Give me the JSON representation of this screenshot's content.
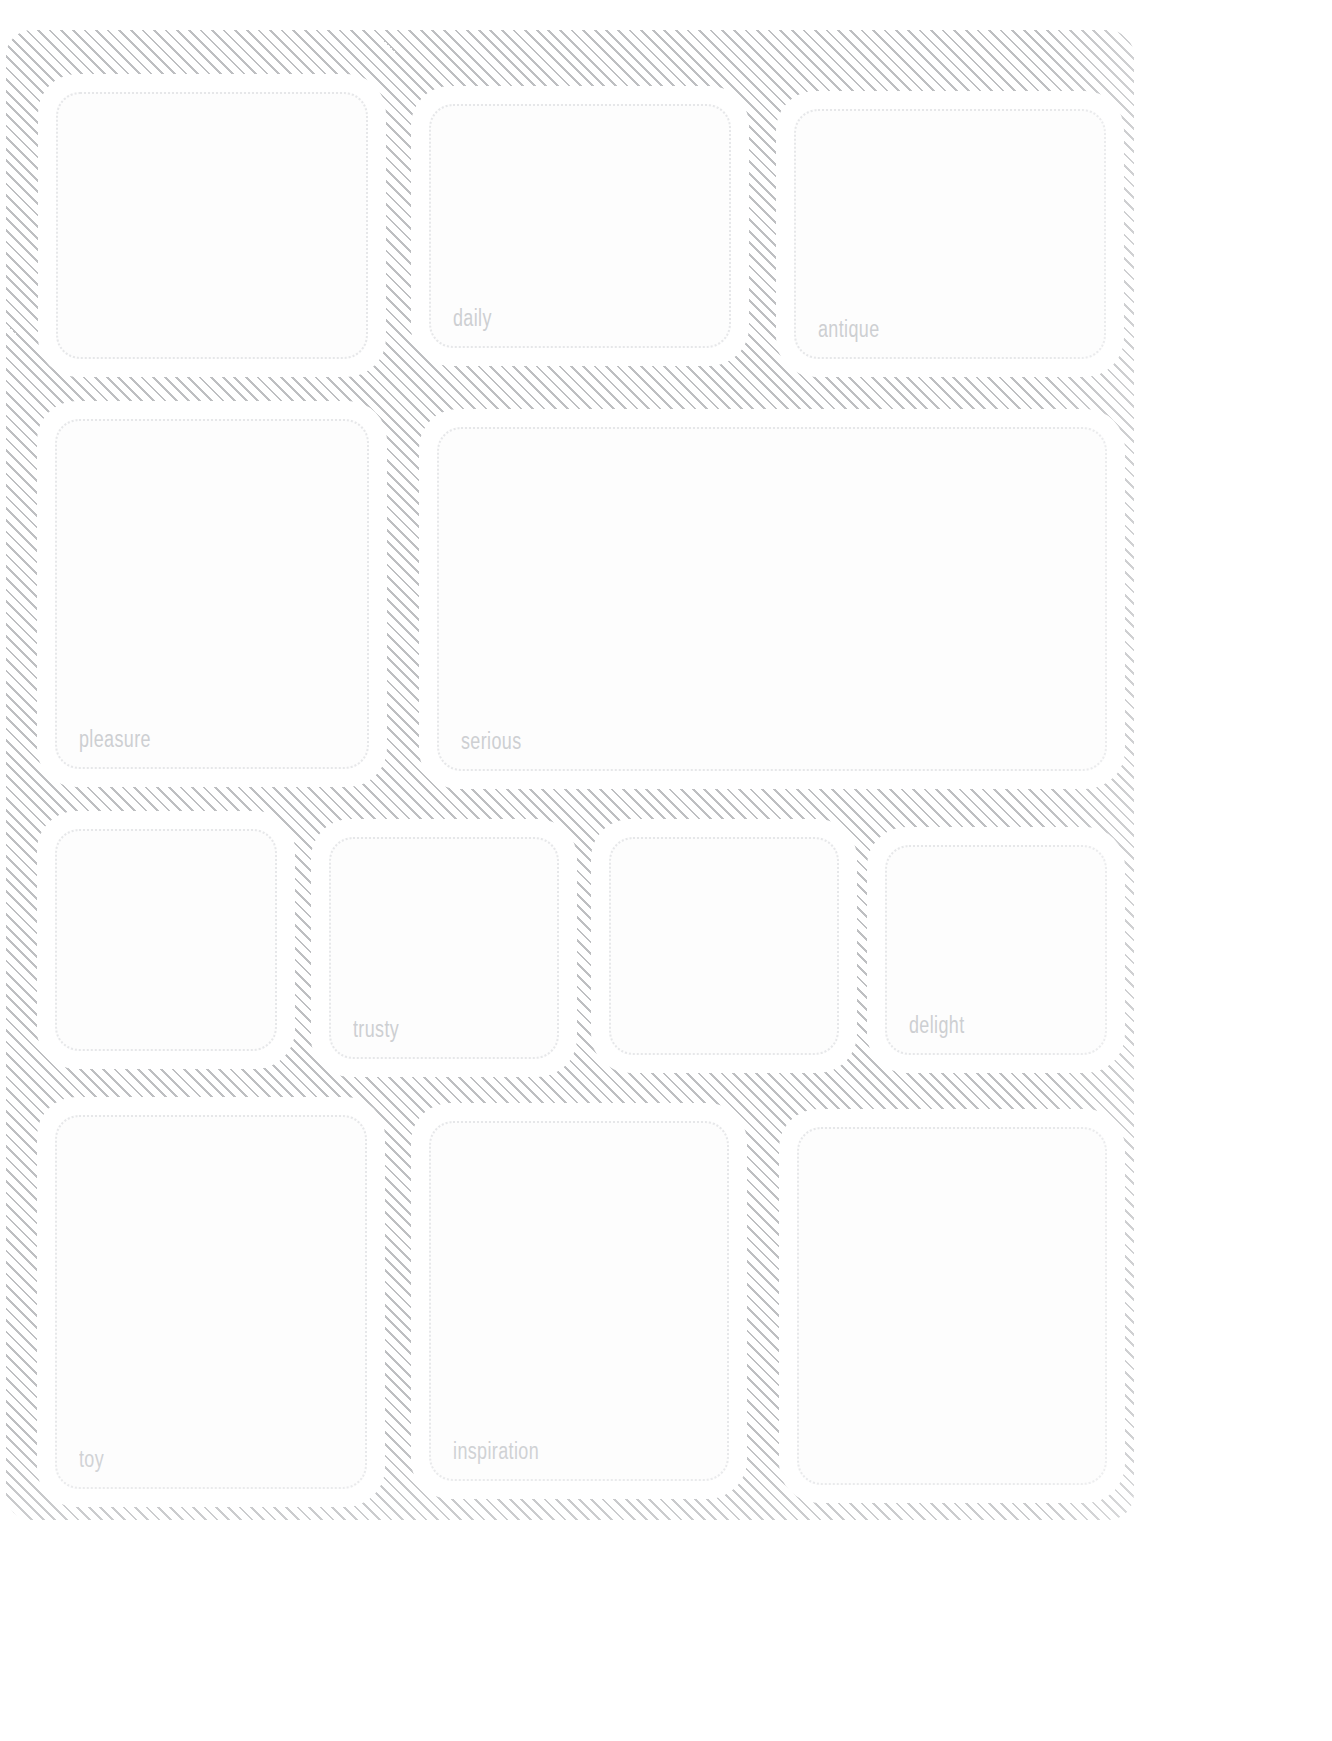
{
  "page": {
    "background_style": "diagonal-hatch",
    "hatch_color": "#96989c",
    "card_fill": "#ffffff",
    "card_border_color": "#e6e7e9",
    "label_color": "#cdcfd2"
  },
  "grid": {
    "rows": [
      {
        "row_name": "row-1",
        "cards": [
          {
            "label": "",
            "x": 47,
            "y": 83,
            "w": 330,
            "h": 285
          },
          {
            "label": "daily",
            "x": 420,
            "y": 95,
            "w": 320,
            "h": 262
          },
          {
            "label": "antique",
            "x": 785,
            "y": 100,
            "w": 330,
            "h": 268
          }
        ]
      },
      {
        "row_name": "row-2",
        "cards": [
          {
            "label": "pleasure",
            "x": 46,
            "y": 410,
            "w": 332,
            "h": 368
          },
          {
            "label": "serious",
            "x": 428,
            "y": 418,
            "w": 688,
            "h": 362
          }
        ]
      },
      {
        "row_name": "row-3",
        "cards": [
          {
            "label": "",
            "x": 46,
            "y": 820,
            "w": 240,
            "h": 240
          },
          {
            "label": "trusty",
            "x": 320,
            "y": 828,
            "w": 248,
            "h": 240
          },
          {
            "label": "",
            "x": 600,
            "y": 828,
            "w": 248,
            "h": 236
          },
          {
            "label": "delight",
            "x": 876,
            "y": 836,
            "w": 240,
            "h": 228
          }
        ]
      },
      {
        "row_name": "row-4",
        "cards": [
          {
            "label": "toy",
            "x": 46,
            "y": 1106,
            "w": 330,
            "h": 392
          },
          {
            "label": "inspiration",
            "x": 420,
            "y": 1112,
            "w": 318,
            "h": 378
          },
          {
            "label": "",
            "x": 788,
            "y": 1118,
            "w": 328,
            "h": 376
          }
        ]
      }
    ]
  },
  "labels_in_reading_order": [
    "daily",
    "antique",
    "pleasure",
    "serious",
    "trusty",
    "delight",
    "toy",
    "inspiration"
  ]
}
